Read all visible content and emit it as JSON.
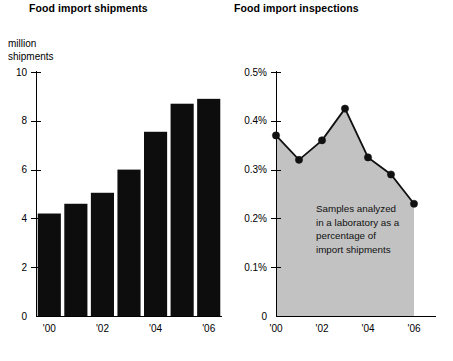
{
  "page": {
    "background_color": "#ffffff",
    "text_color": "#000000"
  },
  "panels": [
    {
      "id": "shipments",
      "title": "Food import shipments",
      "axis_unit_label": "million\nshipments"
    },
    {
      "id": "inspections",
      "title": "Food import inspections",
      "annotation": {
        "lines": [
          "Samples analyzed",
          "in a laboratory as a",
          "percentage of",
          "import shipments"
        ]
      }
    }
  ],
  "chart_data": [
    {
      "type": "bar",
      "title": "Food import shipments",
      "xlabel": "",
      "ylabel": "million shipments",
      "categories": [
        "'00",
        "'01",
        "'02",
        "'03",
        "'04",
        "'05",
        "'06"
      ],
      "tick_labels_shown": [
        "'00",
        "'02",
        "'04",
        "'06"
      ],
      "values": [
        4.2,
        4.6,
        5.05,
        6.0,
        7.55,
        8.7,
        8.9
      ],
      "ylim": [
        0,
        10
      ],
      "yticks": [
        0,
        2,
        4,
        6,
        8,
        10
      ],
      "ytick_labels": [
        "0",
        "2",
        "4",
        "6",
        "8",
        "10"
      ],
      "grid": false,
      "legend": "none",
      "bar_color": "#0d0d0d"
    },
    {
      "type": "area",
      "title": "Food import inspections",
      "xlabel": "",
      "ylabel": "",
      "categories": [
        "'00",
        "'01",
        "'02",
        "'03",
        "'04",
        "'05",
        "'06"
      ],
      "tick_labels_shown": [
        "'00",
        "'02",
        "'04",
        "'06"
      ],
      "values": [
        0.37,
        0.32,
        0.36,
        0.425,
        0.325,
        0.29,
        0.23
      ],
      "ylim": [
        0,
        0.5
      ],
      "yticks": [
        0,
        0.1,
        0.2,
        0.3,
        0.4,
        0.5
      ],
      "ytick_labels": [
        "0",
        "0.1%",
        "0.2%",
        "0.3%",
        "0.4%",
        "0.5%"
      ],
      "grid": false,
      "legend": "none",
      "area_color": "#c2c2c2",
      "line_color": "#111111",
      "marker_color": "#111111",
      "annotation": "Samples analyzed in a laboratory as a percentage of import shipments"
    }
  ]
}
